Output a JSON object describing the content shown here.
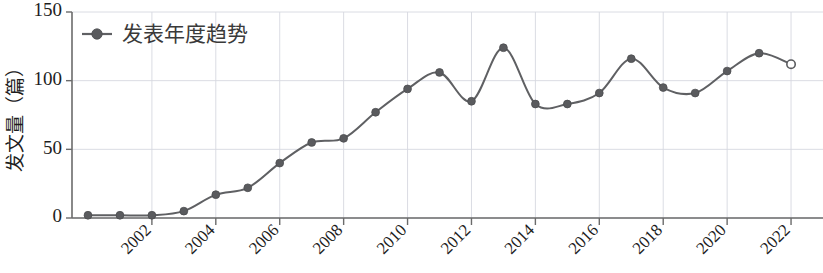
{
  "chart_data": {
    "type": "line",
    "title": "",
    "subtitle": "",
    "xlabel": "",
    "ylabel": "发文量（篇）",
    "legend": {
      "position": "top-left",
      "entries": [
        "发表年度趋势"
      ]
    },
    "grid": true,
    "xlim": [
      1999.5,
      2023.0
    ],
    "ylim": [
      0,
      150
    ],
    "yticks": [
      0,
      50,
      100,
      150
    ],
    "ytick_labels": [
      "0",
      "50",
      "100",
      "150"
    ],
    "xticks": [
      2002,
      2004,
      2006,
      2008,
      2010,
      2012,
      2014,
      2016,
      2018,
      2020,
      2022
    ],
    "xtick_labels": [
      "2002",
      "2004",
      "2006",
      "2008",
      "2010",
      "2012",
      "2014",
      "2016",
      "2018",
      "2020",
      "2022"
    ],
    "x": [
      2000,
      2001,
      2002,
      2003,
      2004,
      2005,
      2006,
      2007,
      2008,
      2009,
      2010,
      2011,
      2012,
      2013,
      2014,
      2015,
      2016,
      2017,
      2018,
      2019,
      2020,
      2021,
      2022
    ],
    "series": [
      {
        "name": "发表年度趋势",
        "values": [
          2,
          2,
          2,
          5,
          17,
          22,
          40,
          55,
          58,
          77,
          94,
          106,
          85,
          124,
          83,
          83,
          91,
          116,
          95,
          91,
          107,
          120,
          112
        ],
        "marker": "circle",
        "last_point_marker": "open-circle",
        "color": "#5a5b5e"
      }
    ],
    "colors": {
      "line": "#5f6063",
      "marker_fill": "#5a5b5e",
      "grid": "#d6d8e0",
      "axis": "#6b6b6b",
      "text": "#1d1d1d",
      "legend_text": "#3a3a3a",
      "background": "#ffffff"
    }
  }
}
